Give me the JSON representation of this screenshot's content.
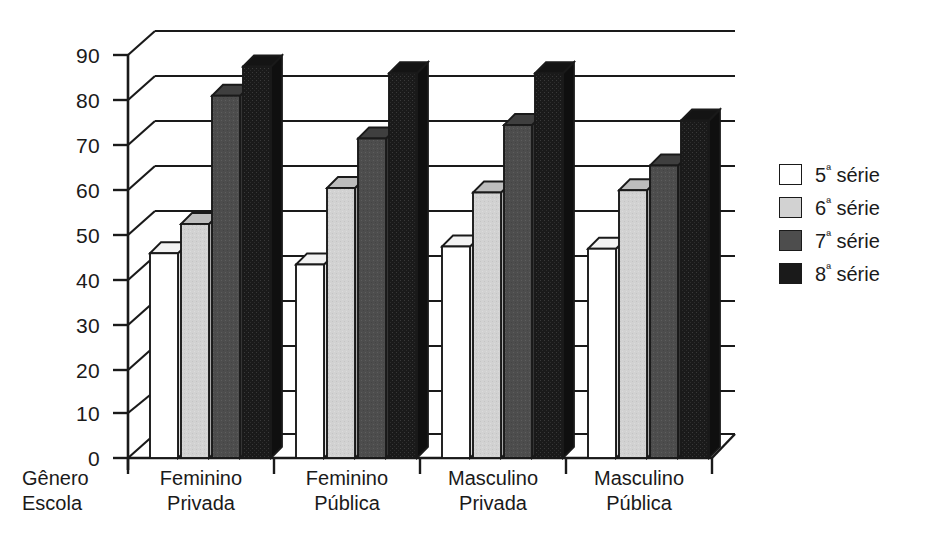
{
  "chart_data": {
    "type": "bar",
    "title": "",
    "xlabel": "Gênero / Escola",
    "ylabel": "",
    "ylim": [
      0,
      90
    ],
    "yticks": [
      0,
      10,
      20,
      30,
      40,
      50,
      60,
      70,
      80,
      90
    ],
    "grid": true,
    "legend_position": "right",
    "categories": [
      "Feminino Privada",
      "Feminino Pública",
      "Masculino Privada",
      "Masculino Pública"
    ],
    "category_lines": [
      [
        "Feminino",
        "Privada"
      ],
      [
        "Feminino",
        "Pública"
      ],
      [
        "Masculino",
        "Privada"
      ],
      [
        "Masculino",
        "Pública"
      ]
    ],
    "series": [
      {
        "name": "5ª série",
        "color": "#ffffff",
        "values": [
          45.5,
          43.0,
          47.0,
          46.5
        ]
      },
      {
        "name": "6ª série",
        "color": "#d0d0d0",
        "values": [
          52.0,
          60.0,
          59.0,
          59.5
        ]
      },
      {
        "name": "7ª série",
        "color": "#4d4d4d",
        "values": [
          80.5,
          71.0,
          74.0,
          65.0
        ]
      },
      {
        "name": "8ª série",
        "color": "#1a1a1a",
        "values": [
          87.0,
          85.5,
          85.5,
          75.0
        ]
      }
    ]
  },
  "axis": {
    "y_tick_labels": [
      "90",
      "80",
      "70",
      "60",
      "50",
      "40",
      "30",
      "20",
      "10",
      "0"
    ],
    "corner_label_line1": "Gênero",
    "corner_label_line2": "Escola"
  },
  "legend": {
    "items": [
      {
        "number": "5",
        "ordinal": "ª",
        "word": "série",
        "color": "#ffffff"
      },
      {
        "number": "6",
        "ordinal": "ª",
        "word": "série",
        "color": "#d0d0d0"
      },
      {
        "number": "7",
        "ordinal": "ª",
        "word": "série",
        "color": "#4d4d4d"
      },
      {
        "number": "8",
        "ordinal": "ª",
        "word": "série",
        "color": "#1a1a1a"
      }
    ]
  }
}
